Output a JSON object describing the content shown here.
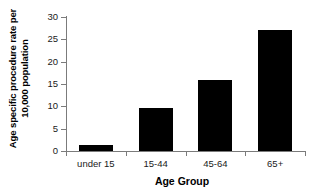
{
  "chart_data": {
    "type": "bar",
    "title": "",
    "categories": [
      "under 15",
      "15-44",
      "45-64",
      "65+"
    ],
    "values": [
      1.3,
      9.7,
      15.8,
      27.0
    ],
    "series": [
      {
        "name": "Age specific procedure rate per 10,000 population",
        "values": [
          1.3,
          9.7,
          15.8,
          27.0
        ]
      }
    ],
    "xlabel": "Age Group",
    "ylabel": "Age specific procedure rate per\n10,000 population",
    "ylim": [
      0,
      30
    ],
    "yticks": [
      0,
      5,
      10,
      15,
      20,
      25,
      30
    ],
    "ytick_labels": [
      "0",
      "5",
      "10",
      "15",
      "20",
      "25",
      "30"
    ],
    "grid": false,
    "legend": false,
    "bar_color": "#000000",
    "axis_color": "#7b7b7b",
    "background_color": "#ffffff"
  },
  "axes": {
    "x_title": "Age Group",
    "y_title": "Age specific procedure rate per\n10,000 population"
  }
}
